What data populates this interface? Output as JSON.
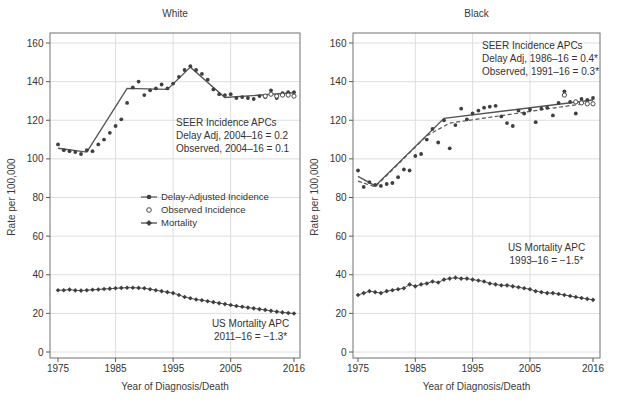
{
  "chart_data": [
    {
      "type": "line",
      "title": "White",
      "xlabel": "Year of Diagnosis/Death",
      "ylabel": "Rate per 100,000",
      "xlim": [
        1973,
        2018
      ],
      "ylim": [
        0,
        160
      ],
      "xticks": [
        1975,
        1985,
        1995,
        2005,
        2016
      ],
      "yticks": [
        0,
        20,
        40,
        60,
        80,
        100,
        120,
        140,
        160
      ],
      "grid_x": [
        1985,
        1995,
        2005
      ],
      "start_year": 1975,
      "incidence_dots": {
        "name": "Delay-Adjusted Incidence",
        "values": [
          107.5,
          104.5,
          104,
          103.5,
          102.5,
          104.5,
          104,
          107.5,
          110,
          113.5,
          117,
          120.5,
          129,
          137,
          140,
          133,
          135.5,
          136.5,
          138.5,
          136.5,
          139,
          142.5,
          146,
          148,
          146,
          144,
          141,
          136,
          133.5,
          133,
          133.5,
          131.5,
          132,
          131.5,
          131,
          132.5,
          132,
          135.5,
          131.5,
          134,
          134.5,
          134.5
        ]
      },
      "observed_dots": {
        "name": "Observed Incidence",
        "years": [
          2011,
          2012,
          2013,
          2014,
          2015,
          2016
        ],
        "values": [
          132.5,
          133.5,
          132.5,
          133,
          133,
          132.5
        ]
      },
      "mortality": {
        "name": "Mortality",
        "values": [
          32,
          32,
          32.3,
          31.9,
          31.8,
          32,
          32.2,
          32.4,
          32.6,
          32.8,
          33,
          33.2,
          33.3,
          33.3,
          33.2,
          33,
          32.5,
          32,
          31.5,
          31,
          30.5,
          29.5,
          28.5,
          27.8,
          27.2,
          26.8,
          26.3,
          25.8,
          25.3,
          24.8,
          24.3,
          23.8,
          23.4,
          23,
          22.6,
          22.2,
          21.8,
          21.3,
          20.9,
          20.5,
          20.2,
          19.9
        ]
      },
      "trend_lines": [
        {
          "name": "Delay-Adjusted Joinpoint Trend",
          "style": "solid",
          "points": [
            [
              1975,
              105.5
            ],
            [
              1980,
              103.5
            ],
            [
              1987,
              136.5
            ],
            [
              1994,
              136
            ],
            [
              1998,
              147.5
            ],
            [
              2004,
              131.8
            ],
            [
              2016,
              134.2
            ]
          ]
        }
      ],
      "annotations": {
        "incidence_apc": {
          "lines": [
            "SEER Incidence APCs",
            "Delay Adj, 2004–16 = 0.2",
            "Observed, 2004–16 = 0.1"
          ]
        },
        "mortality_apc": {
          "lines": [
            "US Mortality APC",
            "2011–16 = −1.3*"
          ]
        }
      },
      "legend": {
        "items": [
          "Delay-Adjusted Incidence",
          "Observed Incidence",
          "Mortality"
        ]
      }
    },
    {
      "type": "line",
      "title": "Black",
      "xlabel": "Year of Diagnosis/Death",
      "ylabel": "Rate per 100,000",
      "xlim": [
        1973,
        2018
      ],
      "ylim": [
        0,
        160
      ],
      "xticks": [
        1975,
        1985,
        1995,
        2005,
        2016
      ],
      "yticks": [
        0,
        20,
        40,
        60,
        80,
        100,
        120,
        140,
        160
      ],
      "grid_x": [
        1985,
        1995,
        2005
      ],
      "start_year": 1975,
      "incidence_dots": {
        "name": "Delay-Adjusted Incidence",
        "values": [
          94,
          85.5,
          88,
          86.5,
          86,
          87,
          87.5,
          90.5,
          94.5,
          94,
          101.5,
          102.5,
          110,
          115.5,
          108.5,
          120,
          105.5,
          117.5,
          126,
          120.5,
          123.5,
          125,
          126.5,
          127,
          127.5,
          122,
          118.5,
          117,
          125,
          123.5,
          125.5,
          119,
          126,
          126.5,
          122.5,
          129,
          135,
          129.5,
          123.5,
          131,
          130.5,
          131.5
        ]
      },
      "observed_dots": {
        "name": "Observed Incidence",
        "years": [
          2011,
          2013,
          2014,
          2015,
          2016
        ],
        "values": [
          133,
          129.5,
          129,
          128.5,
          128.5
        ]
      },
      "mortality": {
        "name": "Mortality",
        "values": [
          29.5,
          30.5,
          31.5,
          31,
          30.5,
          31.5,
          32,
          32.5,
          33,
          35,
          34,
          35,
          35.5,
          36.5,
          36,
          37.5,
          38,
          38.5,
          38,
          38,
          37.5,
          37,
          36.5,
          35.5,
          35,
          34.5,
          34.5,
          34,
          33.5,
          33,
          32.5,
          31.5,
          31,
          30.5,
          30.5,
          30,
          29.5,
          29,
          28.5,
          28,
          27.5,
          27
        ]
      },
      "trend_lines": [
        {
          "name": "Delay-Adjusted Joinpoint Trend",
          "style": "solid",
          "points": [
            [
              1975,
              91
            ],
            [
              1978,
              86
            ],
            [
              1990,
              121
            ],
            [
              2016,
              130.5
            ]
          ]
        },
        {
          "name": "Observed Joinpoint Trend",
          "style": "dashed",
          "points": [
            [
              1975,
              88.5
            ],
            [
              1978,
              85.5
            ],
            [
              1987,
              112
            ],
            [
              1991,
              118.5
            ],
            [
              2016,
              129.3
            ]
          ]
        }
      ],
      "annotations": {
        "incidence_apc": {
          "lines": [
            "SEER Incidence APCs",
            "Delay Adj, 1986–16 = 0.4*",
            "Observed, 1991–16 = 0.3*"
          ]
        },
        "mortality_apc": {
          "lines": [
            "US Mortality APC",
            "1993–16 = −1.5*"
          ]
        }
      }
    }
  ],
  "colors": {
    "dot": "#3f3f3f",
    "line": "#555555",
    "gridline": "#dedede",
    "frame": "#7d7d7d",
    "text": "#333333"
  }
}
